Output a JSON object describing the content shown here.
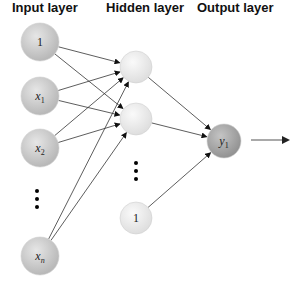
{
  "titles": {
    "input": "Input layer",
    "hidden": "Hidden layer",
    "output": "Output layer"
  },
  "input_nodes": [
    {
      "label": "1",
      "sub": "",
      "cx": 40,
      "cy": 42
    },
    {
      "label": "x",
      "sub": "1",
      "cx": 40,
      "cy": 96
    },
    {
      "label": "x",
      "sub": "2",
      "cx": 40,
      "cy": 148
    },
    {
      "label": "x",
      "sub": "n",
      "cx": 40,
      "cy": 256
    }
  ],
  "hidden_nodes": [
    {
      "label": "",
      "cx": 136,
      "cy": 67
    },
    {
      "label": "",
      "cx": 136,
      "cy": 119
    },
    {
      "label": "1",
      "cx": 136,
      "cy": 218
    }
  ],
  "output_node": {
    "label": "y",
    "sub": "1",
    "cx": 224,
    "cy": 141
  },
  "ellipsis": {
    "input": {
      "x": 37,
      "ys": [
        191,
        199,
        207
      ]
    },
    "hidden": {
      "x": 136,
      "ys": [
        163,
        171,
        179
      ]
    }
  },
  "output_arrow": {
    "x1": 251,
    "y1": 140,
    "x2": 288,
    "y2": 140
  },
  "colors": {
    "input_node": "#c8c8c8",
    "hidden_node": "#ececec",
    "output_node": "#a8a8a8",
    "edge": "#333333"
  }
}
